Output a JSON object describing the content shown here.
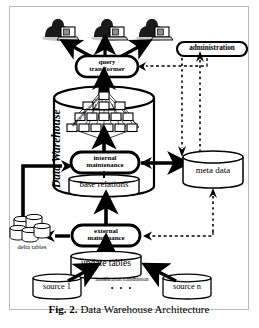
{
  "figure": {
    "caption_prefix": "Fig. 2.",
    "caption_text": "Data Warehouse Architecture"
  },
  "nodes": {
    "administration": "administration",
    "query_transformer_line1": "query",
    "query_transformer_line2": "transformer",
    "warehouse_label": "Data Warehouse",
    "hierarchy_label": "aggregation hierarchy",
    "internal_maintenance_line1": "internal",
    "internal_maintenance_line2": "maintenance",
    "base_relations": "base relations",
    "meta_data": "meta data",
    "external_maintenance_line1": "external",
    "external_maintenance_line2": "maintenance",
    "update_tables": "update tables",
    "delta_tables": "delta tables",
    "source_first": "source 1",
    "source_last": "source n",
    "modification_transmission": "modification transmission",
    "ellipsis": "•  •  •"
  },
  "icons": {
    "user_workstation_1": "user-workstation-icon",
    "user_workstation_2": "user-workstation-icon",
    "user_workstation_3": "user-workstation-icon",
    "delta_tables_stack": "database-stack-icon",
    "meta_data_cylinder": "database-cylinder-icon",
    "base_relations_cylinder": "database-cylinder-icon",
    "update_tables_cylinder": "database-cylinder-icon",
    "source_cylinder_1": "database-cylinder-icon",
    "source_cylinder_n": "database-cylinder-icon",
    "warehouse_cylinder": "data-warehouse-cylinder-icon"
  },
  "colors": {
    "ink": "#000000",
    "frame": "#b9b9b9",
    "paper": "#ffffff",
    "fill": "#ffffff"
  }
}
